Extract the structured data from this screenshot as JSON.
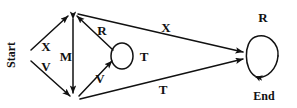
{
  "diagram": {
    "type": "state-transition-diagram",
    "title": "",
    "background_color": "#ffffff",
    "stroke_color": "#111111",
    "nodes": [
      {
        "id": "start",
        "label": "Start",
        "x": 30,
        "y": 55,
        "shape": "vertex",
        "label_rotation": -90,
        "label_x": 11,
        "label_y": 55
      },
      {
        "id": "top",
        "label": "",
        "x": 72,
        "y": 13,
        "shape": "vertex"
      },
      {
        "id": "bottom",
        "label": "",
        "x": 74,
        "y": 99,
        "shape": "vertex"
      },
      {
        "id": "mid",
        "label": "",
        "x": 122,
        "y": 56,
        "shape": "self-loop-ellipse",
        "rx": 11,
        "ry": 13
      },
      {
        "id": "end",
        "label": "End",
        "x": 263,
        "y": 56,
        "shape": "self-loop-ellipse",
        "rx": 15,
        "ry": 19,
        "label_x": 264,
        "label_y": 96
      }
    ],
    "edges": [
      {
        "id": "e1",
        "from": "start",
        "to": "top",
        "label": "X",
        "label_x": 46,
        "label_y": 46
      },
      {
        "id": "e2",
        "from": "start",
        "to": "bottom",
        "label": "V",
        "label_x": 46,
        "label_y": 66
      },
      {
        "id": "e3",
        "from": "top",
        "to": "bottom",
        "label": "M",
        "label_x": 66,
        "label_y": 56,
        "arrows": "both"
      },
      {
        "id": "e4",
        "from": "mid",
        "to": "top",
        "label": "R",
        "label_x": 102,
        "label_y": 30
      },
      {
        "id": "e5",
        "from": "bottom",
        "to": "mid",
        "label": "V",
        "label_x": 100,
        "label_y": 78
      },
      {
        "id": "e6",
        "from": "top",
        "to": "end",
        "label": "X",
        "label_x": 166,
        "label_y": 27
      },
      {
        "id": "e7",
        "from": "bottom",
        "to": "end",
        "label": "T",
        "label_x": 163,
        "label_y": 89
      }
    ],
    "self_loops": [
      {
        "id": "loop-mid",
        "node": "mid",
        "label": "T",
        "label_x": 144,
        "label_y": 56
      },
      {
        "id": "loop-end",
        "node": "end",
        "label": "R",
        "label_x": 263,
        "label_y": 17
      }
    ],
    "labels": {
      "start": "Start",
      "end": "End",
      "x_left": "X",
      "v_left": "V",
      "m": "M",
      "r_mid": "R",
      "v_mid": "V",
      "t_mid": "T",
      "x_right": "X",
      "t_right": "T",
      "r_end": "R"
    }
  }
}
